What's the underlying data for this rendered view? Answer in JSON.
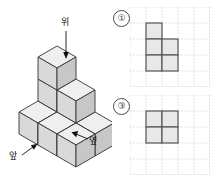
{
  "figure": {
    "name": "isometric-cube-stack",
    "labels": {
      "top": "위",
      "front": "앞",
      "side": "옆"
    },
    "cube_count": 8,
    "colors": {
      "top_face": "#efefef",
      "left_face": "#d8d8d8",
      "right_face": "#c9c9c9",
      "outline": "#333333"
    },
    "layers": [
      {
        "level": 0,
        "cells": [
          [
            0,
            0
          ],
          [
            1,
            0
          ],
          [
            0,
            1
          ],
          [
            1,
            1
          ],
          [
            2,
            0
          ],
          [
            2,
            1
          ]
        ]
      },
      {
        "level": 1,
        "cells": [
          [
            0,
            0
          ],
          [
            0,
            1
          ],
          [
            1,
            0
          ]
        ]
      },
      {
        "level": 2,
        "cells": [
          [
            0,
            0
          ]
        ]
      }
    ]
  },
  "options": [
    {
      "number": "①",
      "shape_name": "p-pentomino",
      "grid": {
        "cols": 5,
        "rows": 5
      },
      "cells": [
        [
          1,
          1
        ],
        [
          1,
          2
        ],
        [
          2,
          2
        ],
        [
          1,
          3
        ],
        [
          2,
          3
        ]
      ],
      "colors": {
        "fill": "#e6e6e6",
        "stroke": "#555555",
        "grid": "#cccccc"
      }
    },
    {
      "number": "③",
      "shape_name": "two-by-two-square",
      "grid": {
        "cols": 5,
        "rows": 5
      },
      "cells": [
        [
          1,
          1
        ],
        [
          2,
          1
        ],
        [
          1,
          2
        ],
        [
          2,
          2
        ]
      ],
      "colors": {
        "fill": "#e6e6e6",
        "stroke": "#555555",
        "grid": "#cccccc"
      }
    }
  ]
}
